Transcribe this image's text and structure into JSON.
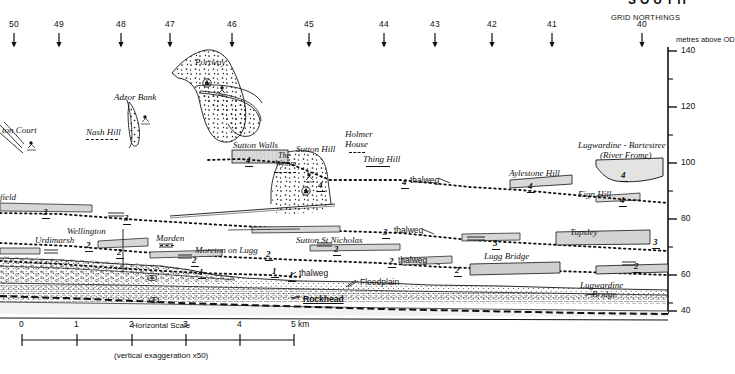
{
  "figure": {
    "header_cutoff": "SOUTH",
    "grid_northings_label": "GRID NORTHINGS",
    "axis_caption": "metres above OD",
    "northings": [
      {
        "label": "50",
        "x": 14
      },
      {
        "label": "49",
        "x": 59
      },
      {
        "label": "48",
        "x": 121
      },
      {
        "label": "47",
        "x": 170
      },
      {
        "label": "46",
        "x": 232
      },
      {
        "label": "45",
        "x": 309
      },
      {
        "label": "44",
        "x": 384
      },
      {
        "label": "43",
        "x": 435
      },
      {
        "label": "42",
        "x": 492
      },
      {
        "label": "41",
        "x": 552
      },
      {
        "label": "40",
        "x": 642
      }
    ],
    "axis_ticks": [
      {
        "label": "140",
        "y": 51
      },
      {
        "label": "",
        "y": 79
      },
      {
        "label": "120",
        "y": 107
      },
      {
        "label": "",
        "y": 135
      },
      {
        "label": "100",
        "y": 163
      },
      {
        "label": "",
        "y": 191
      },
      {
        "label": "80",
        "y": 219
      },
      {
        "label": "",
        "y": 247
      },
      {
        "label": "60",
        "y": 275
      },
      {
        "label": "",
        "y": 303
      },
      {
        "label": "40",
        "y": 311
      }
    ],
    "axis_range": [
      40,
      140
    ],
    "axis_unit": "m OD"
  },
  "places": [
    {
      "id": "sutton-court",
      "label": "ton Court",
      "x": 2,
      "y": 126,
      "style": "place",
      "rule": null
    },
    {
      "id": "nash-hill",
      "label": "Nash Hill",
      "x": 86,
      "y": 128,
      "style": "place",
      "rule": {
        "x": 86,
        "y": 139,
        "w": 32,
        "dash": true
      }
    },
    {
      "id": "adzor-bank",
      "label": "Adzor Bank",
      "x": 114,
      "y": 93,
      "style": "place",
      "rule": null
    },
    {
      "id": "portway",
      "label": "Portway",
      "x": 195,
      "y": 58,
      "style": "place",
      "rule": null
    },
    {
      "id": "sutton-walls",
      "label": "Sutton Walls",
      "x": 233,
      "y": 141,
      "style": "place",
      "rule": null
    },
    {
      "id": "the-wymm",
      "label": "The",
      "x": 278,
      "y": 152,
      "style": "place sm",
      "rule": null
    },
    {
      "id": "the-wymm2",
      "label": "Wymm",
      "x": 275,
      "y": 160,
      "style": "place sm",
      "rule": {
        "x": 274,
        "y": 172,
        "w": 22,
        "dash": true
      }
    },
    {
      "id": "sutton-hill",
      "label": "Sutton Hill",
      "x": 296,
      "y": 145,
      "style": "place",
      "rule": null
    },
    {
      "id": "holmer-house1",
      "label": "Holmer",
      "x": 345,
      "y": 130,
      "style": "place",
      "rule": null
    },
    {
      "id": "holmer-house2",
      "label": "House",
      "x": 345,
      "y": 140,
      "style": "place",
      "rule": {
        "x": 349,
        "y": 152,
        "w": 16,
        "dash": true
      }
    },
    {
      "id": "thing-hill",
      "label": "Thing Hill",
      "x": 363,
      "y": 155,
      "style": "place",
      "rule": {
        "x": 366,
        "y": 166,
        "w": 24,
        "dash": false
      }
    },
    {
      "id": "aylestone-hill",
      "label": "Aylestone Hill",
      "x": 509,
      "y": 169,
      "style": "place",
      "rule": null
    },
    {
      "id": "eign-hill",
      "label": "Eign Hill",
      "x": 578,
      "y": 190,
      "style": "place",
      "rule": null
    },
    {
      "id": "lugwardine-bartestree",
      "label": "Lugwardine - Bartestree",
      "x": 578,
      "y": 141,
      "style": "place",
      "rule": null
    },
    {
      "id": "river-frome",
      "label": "(River Frome)",
      "x": 600,
      "y": 151,
      "style": "place",
      "rule": null
    },
    {
      "id": "xfield",
      "label": "field",
      "x": 0,
      "y": 193,
      "style": "place",
      "rule": null
    },
    {
      "id": "urdimarsh",
      "label": "Urdimarsh",
      "x": 35,
      "y": 236,
      "style": "place",
      "rule": null
    },
    {
      "id": "wellington",
      "label": "Wellington",
      "x": 67,
      "y": 227,
      "style": "place",
      "rule": null
    },
    {
      "id": "marden",
      "label": "Marden",
      "x": 156,
      "y": 234,
      "style": "place",
      "rule": {
        "x": 160,
        "y": 245,
        "w": 14,
        "dash": true
      }
    },
    {
      "id": "moreton-on-lugg",
      "label": "Moreton on Lugg",
      "x": 195,
      "y": 246,
      "style": "place",
      "rule": null
    },
    {
      "id": "sutton-st-nicholas",
      "label": "Sutton St Nicholas",
      "x": 296,
      "y": 236,
      "style": "place",
      "rule": null
    },
    {
      "id": "tupsley",
      "label": "Tupsley",
      "x": 570,
      "y": 228,
      "style": "place",
      "rule": null
    },
    {
      "id": "lugg-bridge",
      "label": "Lugg Bridge",
      "x": 484,
      "y": 252,
      "style": "place",
      "rule": null
    },
    {
      "id": "lugwardine-br1",
      "label": "Lugwardine",
      "x": 580,
      "y": 281,
      "style": "place",
      "rule": null
    },
    {
      "id": "lugwardine-br2",
      "label": "Bridge",
      "x": 592,
      "y": 290,
      "style": "place",
      "rule": null
    }
  ],
  "terraces": [
    {
      "num": "4",
      "x": 246,
      "y": 156
    },
    {
      "num": "4",
      "x": 318,
      "y": 181
    },
    {
      "num": "4",
      "x": 402,
      "y": 178
    },
    {
      "num": "4",
      "x": 528,
      "y": 182
    },
    {
      "num": "4",
      "x": 620,
      "y": 196
    },
    {
      "num": "4",
      "x": 621,
      "y": 171
    },
    {
      "num": "3",
      "x": 43,
      "y": 208
    },
    {
      "num": "3",
      "x": 124,
      "y": 214
    },
    {
      "num": "3",
      "x": 383,
      "y": 228
    },
    {
      "num": "3",
      "x": 493,
      "y": 239
    },
    {
      "num": "3",
      "x": 653,
      "y": 238
    },
    {
      "num": "2",
      "x": 86,
      "y": 241
    },
    {
      "num": "2",
      "x": 117,
      "y": 248
    },
    {
      "num": "2",
      "x": 192,
      "y": 256
    },
    {
      "num": "2",
      "x": 266,
      "y": 250
    },
    {
      "num": "2",
      "x": 334,
      "y": 245
    },
    {
      "num": "2",
      "x": 389,
      "y": 257
    },
    {
      "num": "2",
      "x": 455,
      "y": 266
    },
    {
      "num": "2",
      "x": 634,
      "y": 262
    },
    {
      "num": "1",
      "x": 199,
      "y": 268
    },
    {
      "num": "1",
      "x": 272,
      "y": 267
    },
    {
      "num": "1",
      "x": 289,
      "y": 271
    }
  ],
  "annotations": [
    {
      "id": "thalweg-4",
      "label": "thalweg",
      "x": 410,
      "y": 176
    },
    {
      "id": "thalweg-3",
      "label": "thalweg",
      "x": 394,
      "y": 226
    },
    {
      "id": "thalweg-2",
      "label": "thalweg",
      "x": 398,
      "y": 256
    },
    {
      "id": "thalweg-1",
      "label": "thalweg",
      "x": 299,
      "y": 269
    },
    {
      "id": "floodplain",
      "label": "Floodplain",
      "x": 360,
      "y": 278
    },
    {
      "id": "rockhead",
      "label": "Rockhead",
      "x": 303,
      "y": 295
    }
  ],
  "scale": {
    "title": "Horizontal Scale",
    "ticks": [
      "0",
      "1",
      "2",
      "3",
      "4",
      "5 km"
    ],
    "tick_x": [
      22,
      77,
      132,
      186,
      240,
      294
    ],
    "bar_left": 22,
    "bar_right": 294,
    "bar_y": 340,
    "exaggeration": "(vertical exaggeration x50)"
  },
  "colors": {
    "ink": "#111111",
    "stipple": "#222222",
    "terrace_fill": "#d8d8d8",
    "gravel_fill": "#e8e8e8"
  }
}
